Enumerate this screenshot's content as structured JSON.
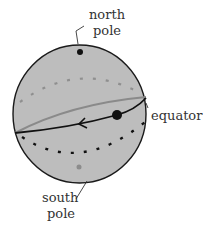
{
  "diagram": {
    "type": "sphere-with-rotation",
    "labels": {
      "north_pole_line1": "north",
      "north_pole_line2": "pole",
      "equator": "equator",
      "south_pole_line1": "south",
      "south_pole_line2": "pole"
    },
    "colors": {
      "sphere_fill": "#bdbdbd",
      "outline": "#1a1a1a",
      "front_curve": "#111111",
      "back_curve": "#8a8a8a",
      "south_dot": "#8c8c8c",
      "label": "#333333"
    }
  }
}
